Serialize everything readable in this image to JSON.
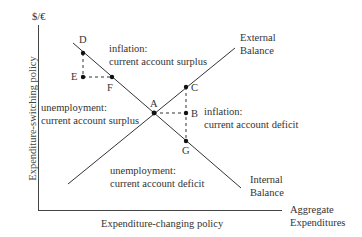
{
  "diagram": {
    "y_axis_unit": "$/€",
    "y_axis_label": "Expenditure-switching policy",
    "x_axis_label": "Expenditure-changing policy",
    "x_axis_end_label": [
      "Aggregate",
      "Expenditures"
    ],
    "curves": {
      "external_balance": [
        "External",
        "Balance"
      ],
      "internal_balance": [
        "Internal",
        "Balance"
      ]
    },
    "regions": {
      "top": [
        "inflation:",
        "current account surplus"
      ],
      "right": [
        "inflation:",
        "current account deficit"
      ],
      "left": [
        "unemployment:",
        "current account surplus"
      ],
      "bottom": [
        "unemployment:",
        "current account deficit"
      ]
    },
    "points": {
      "A": "A",
      "B": "B",
      "C": "C",
      "D": "D",
      "E": "E",
      "F": "F",
      "G": "G"
    }
  },
  "colors": {
    "line": "#333333",
    "text": "#333333",
    "background": "#ffffff"
  }
}
